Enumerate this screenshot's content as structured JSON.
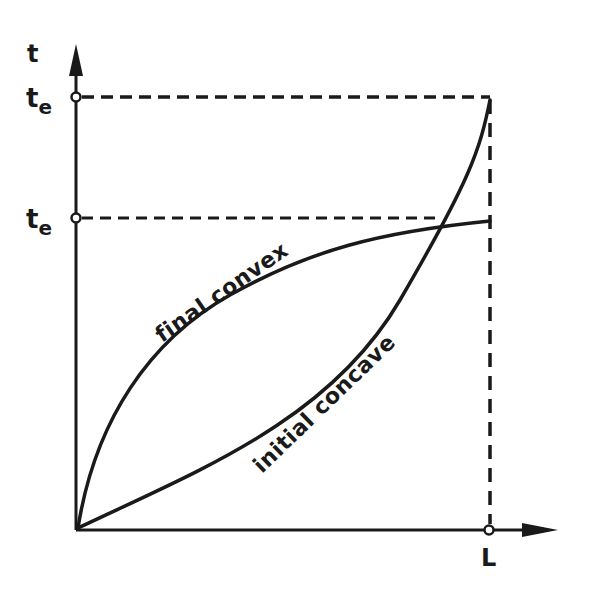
{
  "diagram": {
    "axes": {
      "y_label": "t",
      "x_tick_label": "L",
      "y_ticks": [
        {
          "main": "t",
          "sub": "e"
        },
        {
          "main": "t",
          "sub": "e"
        }
      ]
    },
    "curves": [
      {
        "name": "final-convex",
        "label": "final convex",
        "shape": "convex"
      },
      {
        "name": "initial-concave",
        "label": "initial concave",
        "shape": "concave"
      }
    ],
    "colors": {
      "ink": "#1a1a1a",
      "background": "#ffffff"
    }
  }
}
